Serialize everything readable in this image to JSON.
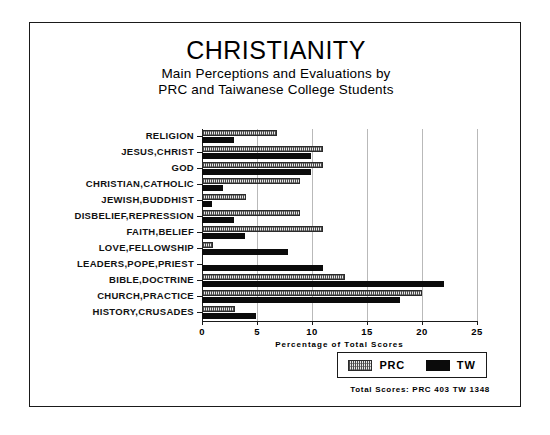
{
  "figure": {
    "title": "CHRISTIANITY",
    "subtitle_line1": "Main Perceptions and Evaluations by",
    "subtitle_line2": "PRC and Taiwanese College Students",
    "footer": "Total Scores:  PRC 403   TW 1348"
  },
  "legend": {
    "position": "bottom-right",
    "entries": [
      {
        "label": "PRC",
        "pattern": "hatched",
        "color": "#e8e8e8"
      },
      {
        "label": "TW",
        "pattern": "solid",
        "color": "#0b0b0b"
      }
    ]
  },
  "chart_data": {
    "type": "bar",
    "orientation": "horizontal",
    "title": "CHRISTIANITY",
    "subtitle": "Main Perceptions and Evaluations by PRC and Taiwanese College Students",
    "xlabel": "Percentage of Total Scores",
    "ylabel": "",
    "xlim": [
      0,
      25
    ],
    "xticks": [
      0,
      5,
      10,
      15,
      20,
      25
    ],
    "xtick_labels": [
      "0",
      "5",
      "10",
      "15",
      "20",
      "25"
    ],
    "grid": true,
    "grid_axis": "x",
    "legend_position": "bottom-right",
    "categories": [
      "RELIGION",
      "JESUS,CHRIST",
      "GOD",
      "CHRISTIAN,CATHOLIC",
      "JEWISH,BUDDHIST",
      "DISBELIEF,REPRESSION",
      "FAITH,BELIEF",
      "LOVE,FELLOWSHIP",
      "LEADERS,POPE,PRIEST",
      "BIBLE,DOCTRINE",
      "CHURCH,PRACTICE",
      "HISTORY,CRUSADES"
    ],
    "series": [
      {
        "name": "PRC",
        "color": "#e8e8e8",
        "pattern": "hatched",
        "total_score": 403,
        "values": [
          6.8,
          11.0,
          11.0,
          8.9,
          4.0,
          8.9,
          11.0,
          1.0,
          0.0,
          13.0,
          20.0,
          3.0
        ]
      },
      {
        "name": "TW",
        "color": "#0b0b0b",
        "pattern": "solid",
        "total_score": 1348,
        "values": [
          2.9,
          9.9,
          9.9,
          1.9,
          0.9,
          2.9,
          3.9,
          7.8,
          11.0,
          22.0,
          18.0,
          4.9
        ]
      }
    ],
    "annotations": [
      "Total Scores:  PRC 403   TW 1348"
    ]
  }
}
